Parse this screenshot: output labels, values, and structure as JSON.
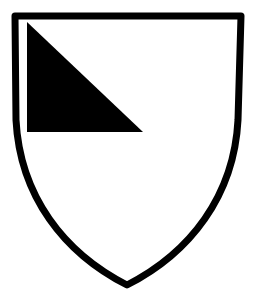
{
  "image": {
    "kind": "line-drawing",
    "subject": "heraldic-shield",
    "title": "Heraldic shield with black triangle in dexter chief",
    "width": 254,
    "height": 305,
    "background_color": "#ffffff"
  },
  "palette": {
    "ink": "#000000",
    "field": "#ffffff"
  },
  "shield": {
    "name": "escutcheon",
    "field_tincture_label": "Argent",
    "field_color": "#ffffff",
    "outline_color": "#000000",
    "outline_width_px": 7,
    "geometry": {
      "top_left": [
        15,
        16
      ],
      "top_right": [
        241,
        16
      ],
      "bottom_point": [
        127,
        285
      ],
      "left_waist": [
        17,
        150
      ],
      "right_waist": [
        237,
        150
      ],
      "path": "M 15 16 L 241 16 L 238 120 C 234 196 190 253 127 285 C 64 253 20 196 16 120 Z"
    }
  },
  "charge": {
    "name": "triangle-charge",
    "tincture_label": "Sable",
    "color": "#000000",
    "position_label": "dexter chief",
    "shape": "right-triangle",
    "vertices": [
      [
        27,
        22
      ],
      [
        27,
        132
      ],
      [
        143,
        132
      ]
    ],
    "path": "M 27 22 L 143 132 L 27 132 Z"
  }
}
